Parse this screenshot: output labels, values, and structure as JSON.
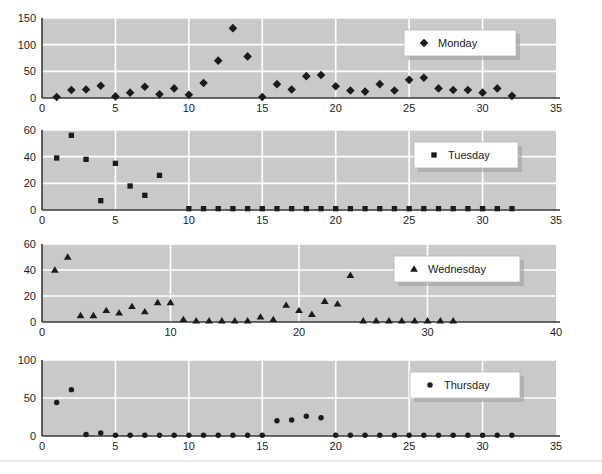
{
  "figure": {
    "background_color": "#ffffff",
    "plot_background_color": "#c9c9c9",
    "gridline_color": "#ffffff",
    "marker_color": "#1b1b1b",
    "axis_color": "#3a3a3a",
    "panel_count": 4
  },
  "chart_data": [
    {
      "type": "scatter",
      "title": "",
      "xlabel": "",
      "ylabel": "",
      "legend": "Monday",
      "legend_position": "top-right",
      "marker": "diamond",
      "grid": true,
      "xlim": [
        0,
        35
      ],
      "ylim": [
        0,
        150
      ],
      "xticks": [
        0,
        5,
        10,
        15,
        20,
        25,
        30,
        35
      ],
      "yticks": [
        0,
        50,
        100,
        150
      ],
      "x": [
        1,
        2,
        3,
        4,
        5,
        6,
        7,
        8,
        9,
        10,
        11,
        12,
        13,
        14,
        15,
        16,
        17,
        18,
        19,
        20,
        21,
        22,
        23,
        24,
        25,
        26,
        27,
        28,
        29,
        30,
        31,
        32
      ],
      "values": [
        2,
        15,
        16,
        23,
        3,
        10,
        21,
        7,
        18,
        6,
        28,
        70,
        131,
        78,
        2,
        26,
        16,
        41,
        43,
        22,
        14,
        12,
        26,
        14,
        34,
        38,
        18,
        15,
        15,
        10,
        18,
        4
      ]
    },
    {
      "type": "scatter",
      "title": "",
      "xlabel": "",
      "ylabel": "",
      "legend": "Tuesday",
      "legend_position": "top-right",
      "marker": "square",
      "grid": true,
      "xlim": [
        0,
        35
      ],
      "ylim": [
        0,
        60
      ],
      "xticks": [
        0,
        5,
        10,
        15,
        20,
        25,
        30,
        35
      ],
      "yticks": [
        0,
        20,
        40,
        60
      ],
      "x": [
        1,
        2,
        3,
        4,
        5,
        6,
        7,
        8,
        10,
        11,
        12,
        13,
        14,
        15,
        16,
        17,
        18,
        19,
        20,
        21,
        22,
        23,
        24,
        25,
        26,
        27,
        28,
        29,
        30,
        31,
        32
      ],
      "values": [
        39,
        56,
        38,
        7,
        35,
        18,
        11,
        26,
        1,
        1,
        1,
        1,
        1,
        1,
        1,
        1,
        1,
        1,
        1,
        1,
        1,
        1,
        1,
        1,
        1,
        1,
        1,
        1,
        1,
        1,
        1
      ]
    },
    {
      "type": "scatter",
      "title": "",
      "xlabel": "",
      "ylabel": "",
      "legend": "Wednesday",
      "legend_position": "top-right",
      "marker": "triangle",
      "grid": true,
      "xlim": [
        0,
        40
      ],
      "ylim": [
        0,
        60
      ],
      "xticks": [
        0,
        10,
        20,
        30,
        40
      ],
      "yticks": [
        0,
        20,
        40,
        60
      ],
      "x": [
        1,
        2,
        3,
        4,
        5,
        6,
        7,
        8,
        9,
        10,
        11,
        12,
        13,
        14,
        15,
        16,
        17,
        18,
        19,
        20,
        21,
        22,
        23,
        24,
        25,
        26,
        27,
        28,
        29,
        30,
        31,
        32
      ],
      "values": [
        40,
        50,
        5,
        5,
        9,
        7,
        12,
        8,
        15,
        15,
        2,
        1,
        1,
        1,
        1,
        1,
        4,
        2,
        13,
        9,
        6,
        16,
        14,
        36,
        1,
        1,
        1,
        1,
        1,
        1,
        1,
        1
      ]
    },
    {
      "type": "scatter",
      "title": "",
      "xlabel": "",
      "ylabel": "",
      "legend": "Thursday",
      "legend_position": "top-right",
      "marker": "circle",
      "grid": true,
      "xlim": [
        0,
        35
      ],
      "ylim": [
        0,
        100
      ],
      "xticks": [
        0,
        5,
        10,
        15,
        20,
        25,
        30,
        35
      ],
      "yticks": [
        0,
        50,
        100
      ],
      "x": [
        1,
        2,
        3,
        4,
        5,
        6,
        7,
        8,
        9,
        10,
        11,
        12,
        13,
        14,
        15,
        16,
        17,
        18,
        19,
        20,
        21,
        22,
        23,
        24,
        25,
        26,
        27,
        28,
        29,
        30,
        31,
        32
      ],
      "values": [
        44,
        61,
        2,
        4,
        1,
        1,
        1,
        1,
        1,
        1,
        1,
        1,
        1,
        1,
        1,
        20,
        21,
        26,
        24,
        1,
        1,
        1,
        1,
        1,
        1,
        1,
        1,
        1,
        1,
        1,
        1,
        1
      ]
    }
  ]
}
